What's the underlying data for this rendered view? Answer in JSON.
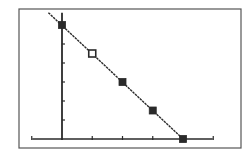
{
  "screen": {
    "background": "#ffffff",
    "frame_color": "#555555",
    "ink_color": "#2a2a2a"
  },
  "chart_data": {
    "type": "line",
    "title": "",
    "xlabel": "",
    "ylabel": "",
    "grid": false,
    "legend": null,
    "xlim": [
      -1,
      5
    ],
    "ylim": [
      -0.5,
      6.5
    ],
    "x_ticks": [
      -1,
      0,
      1,
      2,
      3,
      4,
      5
    ],
    "y_ticks": [
      1,
      2,
      3,
      4,
      5,
      6
    ],
    "series": [
      {
        "name": "line",
        "style": "dotted-line",
        "x": [
          -0.45,
          4
        ],
        "y": [
          6.65,
          0
        ]
      },
      {
        "name": "points",
        "style": "square-markers",
        "x": [
          0,
          1,
          2,
          3,
          4
        ],
        "y": [
          6,
          4.5,
          3,
          1.5,
          0
        ],
        "filled": [
          true,
          false,
          true,
          true,
          true
        ]
      }
    ]
  }
}
